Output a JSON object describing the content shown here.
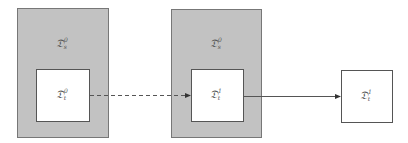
{
  "diagram": {
    "groups": [
      {
        "id": "group-0",
        "outer_label": {
          "base": "𝔇",
          "sup": "0",
          "sub": "s"
        },
        "inner_label": {
          "base": "𝔇",
          "sup": "0",
          "sub": "t"
        }
      },
      {
        "id": "group-1",
        "outer_label": {
          "base": "𝔇",
          "sup": "0",
          "sub": "s"
        },
        "inner_label": {
          "base": "𝔇",
          "sup": "1",
          "sub": "t"
        }
      }
    ],
    "standalone": {
      "label": {
        "base": "𝔇",
        "sup": "1",
        "sub": "t"
      }
    },
    "arrows": [
      {
        "from": "group-0-inner",
        "to": "group-1-inner",
        "style": "dashed"
      },
      {
        "from": "group-1-inner",
        "to": "standalone",
        "style": "solid"
      }
    ],
    "colors": {
      "outer_fill": "#c2c2c2",
      "inner_fill": "#ffffff",
      "stroke": "#555555"
    }
  }
}
